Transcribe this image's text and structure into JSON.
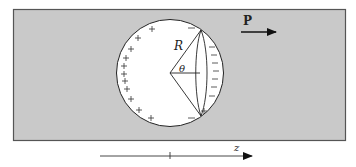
{
  "diagram": {
    "type": "physics-schematic",
    "labels": {
      "polarization": "P",
      "radius": "R",
      "angle": "θ",
      "axis": "z"
    },
    "charges": {
      "left_side_sign": "+",
      "right_side_sign": "−"
    },
    "colors": {
      "medium": "#c8c8c8",
      "cavity": "#ffffff",
      "stroke": "#222222"
    }
  }
}
